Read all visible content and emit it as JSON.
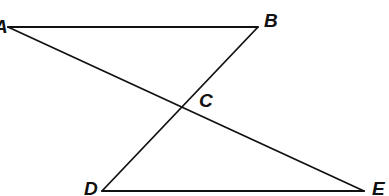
{
  "diagram": {
    "type": "geometry",
    "colors": {
      "line": "#111111",
      "background": "#ffffff"
    },
    "points": {
      "A": {
        "label": "A",
        "x": 8,
        "y": 27
      },
      "B": {
        "label": "B",
        "x": 258,
        "y": 27
      },
      "C": {
        "label": "C",
        "x": 181,
        "y": 111
      },
      "D": {
        "label": "D",
        "x": 102,
        "y": 191
      },
      "E": {
        "label": "E",
        "x": 364,
        "y": 191
      }
    },
    "segments": [
      {
        "from": "A",
        "to": "B"
      },
      {
        "from": "D",
        "to": "E"
      },
      {
        "from": "A",
        "to": "E"
      },
      {
        "from": "B",
        "to": "D"
      }
    ],
    "labels": {
      "A": "A",
      "B": "B",
      "C": "C",
      "D": "D",
      "E": "E"
    }
  }
}
